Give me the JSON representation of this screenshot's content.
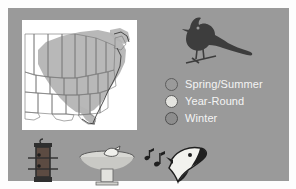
{
  "panel": {
    "background_color": "#9a9a9a",
    "page_background": "#ffffff"
  },
  "map": {
    "name": "north-american-range-map",
    "region": "Eastern United States",
    "background_color": "#ffffff",
    "range_shading_color": "#b4b4b4",
    "state_outline_color": "#7a7a7a",
    "coast_outline_color": "#3a3a3a"
  },
  "bird": {
    "name": "cardinal-silhouette",
    "color": "#3d3d3d",
    "description": "crested songbird perched on branch"
  },
  "legend": {
    "title": "",
    "items": [
      {
        "label": "Spring/Summer",
        "swatch_color": "#9a9a9a",
        "outline_color": "#5d5d5d"
      },
      {
        "label": "Year-Round",
        "swatch_color": "#e4e4e0",
        "outline_color": "#5d5d5d"
      },
      {
        "label": "Winter",
        "swatch_color": "#8d8d8d",
        "outline_color": "#4f4f4f"
      }
    ],
    "text_color": "#f4f4f4"
  },
  "icons": [
    {
      "name": "tube-feeder-icon",
      "label": "Tube feeder",
      "color": "#2f2f2f"
    },
    {
      "name": "birdbath-icon",
      "label": "Birdbath",
      "color": "#d8d8d4"
    },
    {
      "name": "bird-song-icon",
      "label": "Bird song",
      "color": "#1f1f1f"
    }
  ]
}
